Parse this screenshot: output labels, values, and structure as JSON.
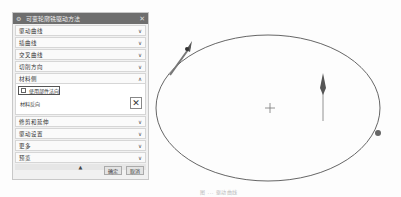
{
  "dialog": {
    "title": "可变轮廓铣驱动方法",
    "icons": {
      "title": "gear-icon",
      "close": "close-icon"
    },
    "sections": [
      {
        "label": "驱动曲线",
        "state": "collapsed"
      },
      {
        "label": "插曲线",
        "state": "collapsed"
      },
      {
        "label": "交叉曲线",
        "state": "collapsed"
      },
      {
        "label": "切削方向",
        "state": "collapsed"
      },
      {
        "label": "材料侧",
        "state": "expanded"
      }
    ],
    "material_side": {
      "use_part_normal_label": "使用部件法向",
      "use_part_normal_checked": false,
      "reverse_material_label": "材料反向",
      "reverse_icon": "reverse-direction-icon"
    },
    "sections_after": [
      {
        "label": "修剪和延伸",
        "state": "collapsed"
      },
      {
        "label": "驱动设置",
        "state": "collapsed"
      },
      {
        "label": "更多",
        "state": "collapsed"
      },
      {
        "label": "预览",
        "state": "collapsed"
      }
    ],
    "chevron_down": "∨",
    "chevron_up": "∧",
    "collapse_glyph": "▲",
    "buttons": {
      "ok": "确定",
      "cancel": "取消"
    }
  },
  "viewport": {
    "shape": "ellipse",
    "markers": [
      "tangent-arrow-start",
      "center-crosshair",
      "normal-arrow",
      "endpoint-dot"
    ],
    "crosshair": "+"
  },
  "caption": "图 ... 驱动曲线"
}
